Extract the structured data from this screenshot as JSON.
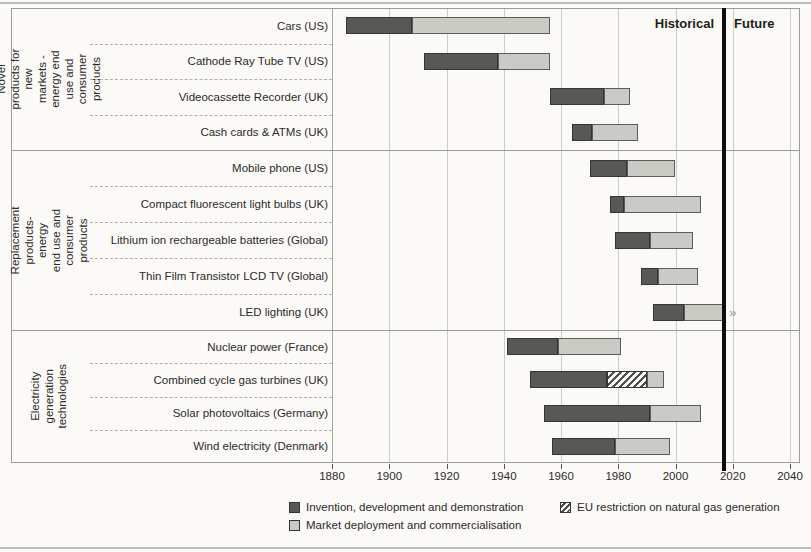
{
  "header": {
    "historical_label": "Historical",
    "future_label": "Future"
  },
  "axis": {
    "min": 1880,
    "max": 2040,
    "tick_step": 20,
    "tick_labels": [
      "1880",
      "1900",
      "1920",
      "1940",
      "1960",
      "1980",
      "2000",
      "2020",
      "2040"
    ]
  },
  "divider": {
    "year": 2017
  },
  "legend": [
    {
      "key": "invention",
      "swatch": "dark",
      "label": "Invention, development and demonstration"
    },
    {
      "key": "deployment",
      "swatch": "light",
      "label": "Market deployment and commercialisation"
    },
    {
      "key": "restriction",
      "swatch": "hatch",
      "label": "EU restriction on natural gas generation"
    }
  ],
  "colors": {
    "invention": "#585856",
    "deployment": "#cbcbc6",
    "restriction_hatch": "#4e4e4b",
    "divider": "#0d0d0d",
    "background": "#fbfaf7"
  },
  "chart_data": {
    "type": "bar",
    "orientation": "horizontal",
    "title": "",
    "xlabel": "Year",
    "xlim": [
      1880,
      2040
    ],
    "grid": true,
    "legend_position": "bottom",
    "annotations": [
      "Historical",
      "Future"
    ],
    "divider_year": 2017,
    "groups": [
      {
        "label": "Novel products for new\nmarkets - energy end\nuse and consumer\nproducts",
        "rows": [
          {
            "label": "Cars (US)",
            "phases": [
              {
                "type": "invention",
                "start": 1885,
                "end": 1908
              },
              {
                "type": "deployment",
                "start": 1908,
                "end": 1956
              }
            ]
          },
          {
            "label": "Cathode Ray Tube TV (US)",
            "phases": [
              {
                "type": "invention",
                "start": 1912,
                "end": 1938
              },
              {
                "type": "deployment",
                "start": 1938,
                "end": 1956
              }
            ]
          },
          {
            "label": "Videocassette Recorder (UK)",
            "phases": [
              {
                "type": "invention",
                "start": 1956,
                "end": 1975
              },
              {
                "type": "deployment",
                "start": 1975,
                "end": 1984
              }
            ]
          },
          {
            "label": "Cash cards & ATMs (UK)",
            "phases": [
              {
                "type": "invention",
                "start": 1964,
                "end": 1971
              },
              {
                "type": "deployment",
                "start": 1971,
                "end": 1987
              }
            ]
          }
        ]
      },
      {
        "label": "Replacement products- energy\nend use and consumer\nproducts",
        "rows": [
          {
            "label": "Mobile phone (US)",
            "phases": [
              {
                "type": "invention",
                "start": 1970,
                "end": 1983
              },
              {
                "type": "deployment",
                "start": 1983,
                "end": 2000
              }
            ]
          },
          {
            "label": "Compact fluorescent light bulbs (UK)",
            "phases": [
              {
                "type": "invention",
                "start": 1977,
                "end": 1982
              },
              {
                "type": "deployment",
                "start": 1982,
                "end": 2009
              }
            ]
          },
          {
            "label": "Lithium ion rechargeable batteries (Global)",
            "phases": [
              {
                "type": "invention",
                "start": 1979,
                "end": 1991
              },
              {
                "type": "deployment",
                "start": 1991,
                "end": 2006
              }
            ]
          },
          {
            "label": "Thin Film Transistor LCD TV (Global)",
            "phases": [
              {
                "type": "invention",
                "start": 1988,
                "end": 1994
              },
              {
                "type": "deployment",
                "start": 1994,
                "end": 2008
              }
            ]
          },
          {
            "label": "LED lighting (UK)",
            "ongoing": true,
            "phases": [
              {
                "type": "invention",
                "start": 1992,
                "end": 2003
              },
              {
                "type": "deployment",
                "start": 2003,
                "end": 2017
              }
            ]
          }
        ]
      },
      {
        "label": "Electricity generation\ntechnologies",
        "rows": [
          {
            "label": "Nuclear power (France)",
            "phases": [
              {
                "type": "invention",
                "start": 1941,
                "end": 1959
              },
              {
                "type": "deployment",
                "start": 1959,
                "end": 1981
              }
            ]
          },
          {
            "label": "Combined cycle gas turbines (UK)",
            "phases": [
              {
                "type": "invention",
                "start": 1949,
                "end": 1976
              },
              {
                "type": "restriction",
                "start": 1976,
                "end": 1990
              },
              {
                "type": "deployment",
                "start": 1990,
                "end": 1996
              }
            ]
          },
          {
            "label": "Solar photovoltaics (Germany)",
            "phases": [
              {
                "type": "invention",
                "start": 1954,
                "end": 1991
              },
              {
                "type": "deployment",
                "start": 1991,
                "end": 2009
              }
            ]
          },
          {
            "label": "Wind electricity (Denmark)",
            "phases": [
              {
                "type": "invention",
                "start": 1957,
                "end": 1979
              },
              {
                "type": "deployment",
                "start": 1979,
                "end": 1998
              }
            ]
          }
        ]
      }
    ]
  }
}
